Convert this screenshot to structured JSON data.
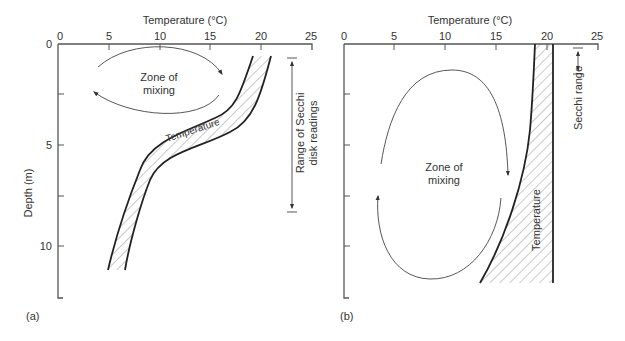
{
  "panel_a": {
    "label": "(a)",
    "x_axis_title": "Temperature (°C)",
    "x_ticks": [
      "0",
      "5",
      "10",
      "15",
      "20",
      "25"
    ],
    "y_axis_title": "Depth (m)",
    "y_ticks": [
      "0",
      "5",
      "10"
    ],
    "zone_label_line1": "Zone of",
    "zone_label_line2": "mixing",
    "curve_label": "Temperature",
    "secchi_label_line1": "Range of Secchi",
    "secchi_label_line2": "disk readings"
  },
  "panel_b": {
    "label": "(b)",
    "x_axis_title": "Temperature (°C)",
    "x_ticks": [
      "0",
      "5",
      "10",
      "15",
      "20",
      "25"
    ],
    "zone_label_line1": "Zone of",
    "zone_label_line2": "mixing",
    "curve_label": "Temperature",
    "secchi_label": "Secchi range"
  },
  "colors": {
    "line": "#222222",
    "axis": "#555555",
    "hatch": "#777777",
    "text": "#333333"
  }
}
